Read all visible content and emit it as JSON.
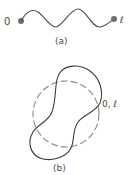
{
  "figure_a": {
    "caption": "(a)",
    "start_label": "0",
    "end_label": "ℓ",
    "description": "open wavy string with endpoints"
  },
  "figure_b": {
    "caption": "(b)",
    "junction_label": "0, ℓ",
    "solid_curve": "deformed closed loop",
    "dashed_curve": "reference circle"
  },
  "colors": {
    "line": "#4a4a4a",
    "dashed": "#8a8a8a",
    "endpoint": "#6e6e6e",
    "text": "#4a4a4a"
  }
}
